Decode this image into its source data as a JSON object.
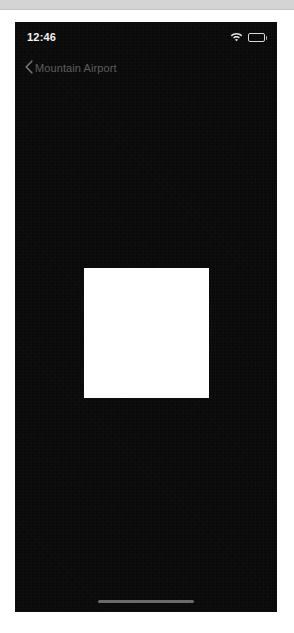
{
  "page_chrome": {
    "top_strip_color": "#d4d4d4"
  },
  "phone": {
    "screen_background": "#0a0a0a",
    "status_bar": {
      "time": "12:46",
      "icons": [
        {
          "name": "wifi-icon",
          "label": "Wi-Fi"
        },
        {
          "name": "battery-icon",
          "label": "Battery"
        }
      ],
      "text_color": "#f2f2f2"
    },
    "nav_bar": {
      "back_icon": "chevron-left-icon",
      "back_label": "Mountain Airport",
      "text_color": "#5e5e5e"
    },
    "content": {
      "placeholder_color": "#ffffff",
      "placeholder_name": "content-placeholder"
    },
    "home_indicator": {
      "name": "home-indicator",
      "color": "#6a6a6a"
    }
  }
}
